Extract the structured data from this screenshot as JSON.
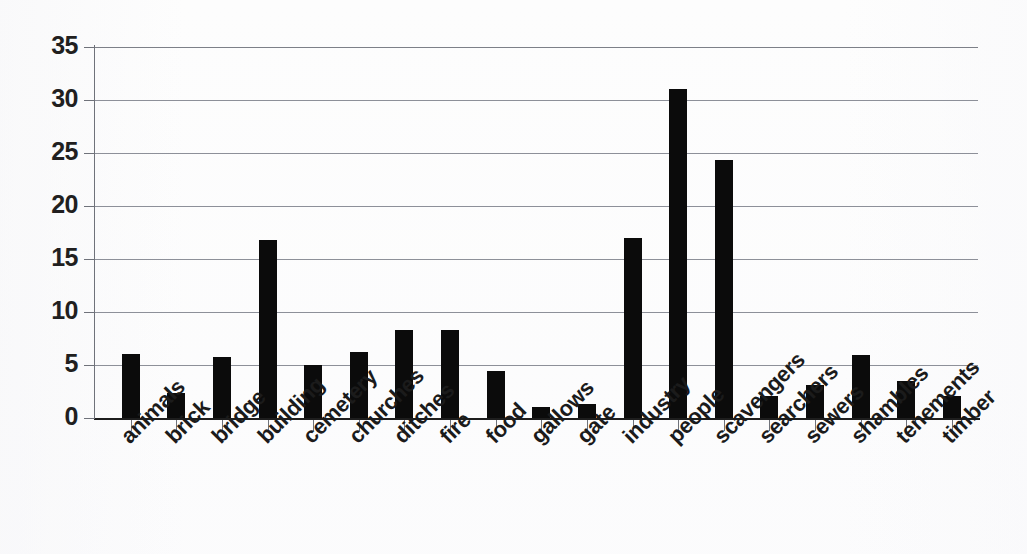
{
  "chart_data": {
    "type": "bar",
    "title": "",
    "subtitle": "",
    "xlabel": "",
    "ylabel": "",
    "ylim": [
      0,
      35
    ],
    "yticks": [
      0,
      5,
      10,
      15,
      20,
      25,
      30,
      35
    ],
    "ytick_labels": [
      "0",
      "5",
      "10",
      "15",
      "20",
      "25",
      "30",
      "35"
    ],
    "grid": true,
    "grid_axis": "y",
    "legend": false,
    "legend_position": "none",
    "bar_color": "#0b0b0b",
    "background_color": "#fdfdfd",
    "axis_color": "#1d1d1d",
    "gridline_color": "#8d9099",
    "categories": [
      "animals",
      "brick",
      "bridge",
      "building",
      "cemetery",
      "churches",
      "ditches",
      "fire",
      "food",
      "gallows",
      "gate",
      "industry",
      "people",
      "scavengers",
      "searchers",
      "sewers",
      "shambles",
      "tenements",
      "timber"
    ],
    "values": [
      6.0,
      2.4,
      5.8,
      16.8,
      5.0,
      6.2,
      8.3,
      8.3,
      4.4,
      1.0,
      1.3,
      17.0,
      31.0,
      24.3,
      2.1,
      3.1,
      5.9,
      3.5,
      2.1
    ]
  }
}
